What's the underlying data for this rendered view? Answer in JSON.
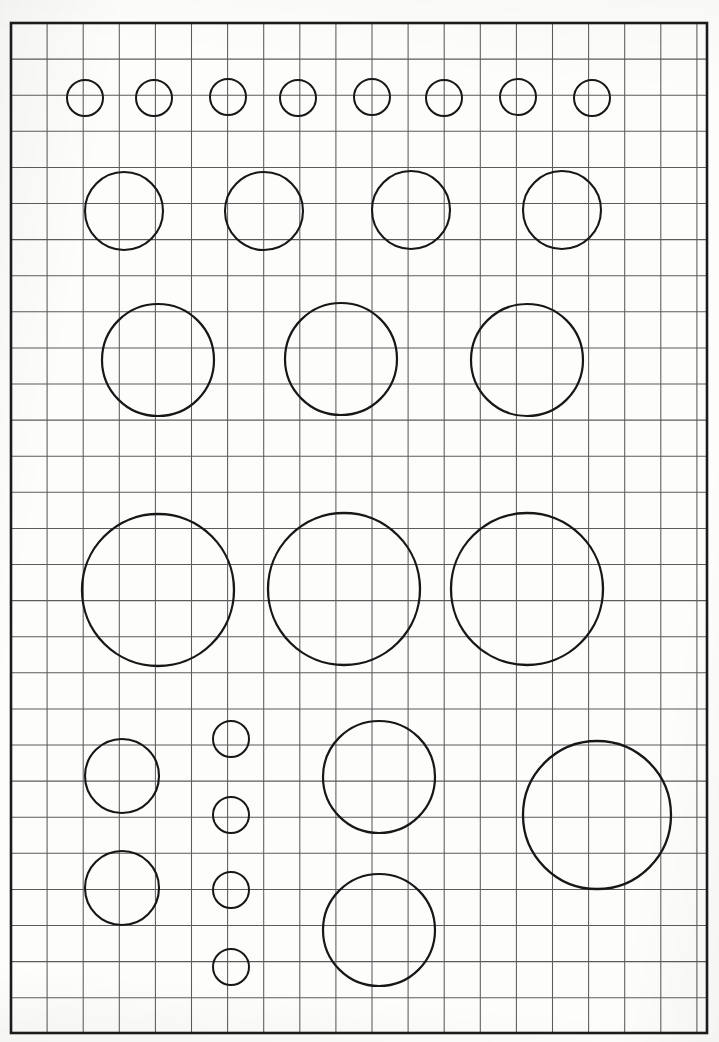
{
  "document": {
    "kind": "graph-paper-worksheet",
    "title": "Grid sheet with hand-drawn circles",
    "page_width": 719,
    "page_height": 1042,
    "background_color": "#fdfdfc"
  },
  "grid": {
    "origin_x": 11,
    "origin_y": 23,
    "cell_size": 36.1,
    "columns": 19,
    "rows": 28,
    "line_color": "#5b5b5b",
    "line_width": 1.05,
    "border_color": "#1b1b1b",
    "border_width": 2.6,
    "border_left": 11,
    "border_top": 23,
    "border_right": 707,
    "border_bottom": 1033
  },
  "circles": {
    "stroke_color": "#171717",
    "fill": "none",
    "groups": [
      {
        "name": "row-1-tiny-circles",
        "label": "Row 1 - eight small circles",
        "radius": 18,
        "stroke_width": 2.0,
        "center_y": 98,
        "items": [
          {
            "cx": 85,
            "cy": 98,
            "r": 18
          },
          {
            "cx": 154,
            "cy": 98,
            "r": 18
          },
          {
            "cx": 228,
            "cy": 97,
            "r": 18
          },
          {
            "cx": 298,
            "cy": 98,
            "r": 18
          },
          {
            "cx": 372,
            "cy": 97,
            "r": 18
          },
          {
            "cx": 444,
            "cy": 98,
            "r": 18
          },
          {
            "cx": 518,
            "cy": 97,
            "r": 18
          },
          {
            "cx": 592,
            "cy": 98,
            "r": 18
          }
        ]
      },
      {
        "name": "row-2-small-circles",
        "label": "Row 2 - four medium-small circles",
        "radius": 39,
        "stroke_width": 2.1,
        "center_y": 211,
        "items": [
          {
            "cx": 124,
            "cy": 211,
            "r": 39
          },
          {
            "cx": 264,
            "cy": 211,
            "r": 39
          },
          {
            "cx": 411,
            "cy": 210,
            "r": 39
          },
          {
            "cx": 562,
            "cy": 210,
            "r": 39
          }
        ]
      },
      {
        "name": "row-3-medium-circles",
        "label": "Row 3 - three medium circles",
        "radius": 56,
        "stroke_width": 2.2,
        "center_y": 360,
        "items": [
          {
            "cx": 158,
            "cy": 360,
            "r": 56
          },
          {
            "cx": 341,
            "cy": 359,
            "r": 56
          },
          {
            "cx": 527,
            "cy": 360,
            "r": 56
          }
        ]
      },
      {
        "name": "row-4-large-circles",
        "label": "Row 4 - three large circles",
        "radius": 76,
        "stroke_width": 2.3,
        "center_y": 590,
        "items": [
          {
            "cx": 158,
            "cy": 590,
            "r": 76
          },
          {
            "cx": 344,
            "cy": 589,
            "r": 76
          },
          {
            "cx": 527,
            "cy": 589,
            "r": 76
          }
        ]
      },
      {
        "name": "bottom-left-medium-pair",
        "label": "Bottom left - two medium circles stacked",
        "radius": 37,
        "stroke_width": 2.1,
        "items": [
          {
            "cx": 122,
            "cy": 776,
            "r": 37
          },
          {
            "cx": 122,
            "cy": 888,
            "r": 37
          }
        ]
      },
      {
        "name": "bottom-tiny-column",
        "label": "Bottom centre - column of four tiny circles",
        "radius": 18,
        "stroke_width": 2.0,
        "items": [
          {
            "cx": 231,
            "cy": 739,
            "r": 18
          },
          {
            "cx": 231,
            "cy": 815,
            "r": 18
          },
          {
            "cx": 231,
            "cy": 890,
            "r": 18
          },
          {
            "cx": 231,
            "cy": 967,
            "r": 18
          }
        ]
      },
      {
        "name": "bottom-centre-pair",
        "label": "Bottom centre-right - two circles stacked",
        "radius": 56,
        "stroke_width": 2.2,
        "items": [
          {
            "cx": 379,
            "cy": 777,
            "r": 56
          },
          {
            "cx": 379,
            "cy": 930,
            "r": 56
          }
        ]
      },
      {
        "name": "bottom-right-large",
        "label": "Bottom right - one large circle",
        "radius": 74,
        "stroke_width": 2.3,
        "items": [
          {
            "cx": 597,
            "cy": 815,
            "r": 74
          }
        ]
      }
    ]
  },
  "summary": {
    "total_circles": 28,
    "distinct_radii": [
      18,
      37,
      39,
      56,
      74,
      76
    ]
  }
}
